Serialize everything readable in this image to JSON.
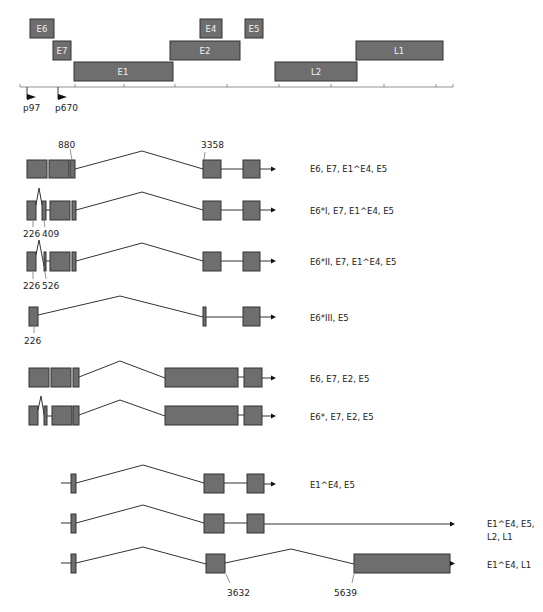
{
  "genome_map": {
    "genes": [
      {
        "name": "E6",
        "x": 30,
        "y": 19,
        "w": 24,
        "h": 19
      },
      {
        "name": "E7",
        "x": 53,
        "y": 41,
        "w": 18,
        "h": 19
      },
      {
        "name": "E1",
        "x": 74,
        "y": 62,
        "w": 99,
        "h": 19
      },
      {
        "name": "E4",
        "x": 200,
        "y": 19,
        "w": 22,
        "h": 19
      },
      {
        "name": "E2",
        "x": 170,
        "y": 41,
        "w": 70,
        "h": 19
      },
      {
        "name": "E5",
        "x": 245,
        "y": 19,
        "w": 18,
        "h": 19
      },
      {
        "name": "L2",
        "x": 275,
        "y": 62,
        "w": 82,
        "h": 19
      },
      {
        "name": "L1",
        "x": 356,
        "y": 41,
        "w": 87,
        "h": 19
      }
    ],
    "axis": {
      "x1": 20,
      "x2": 453,
      "y": 87,
      "ticks": [
        20,
        75,
        124,
        175,
        227,
        279,
        331,
        384,
        436,
        453
      ]
    },
    "promoters": [
      {
        "label": "p97",
        "x": 27
      },
      {
        "label": "p670",
        "x": 58
      }
    ]
  },
  "transcripts": [
    {
      "label": "E6, E7, E1^E4, E5"
    },
    {
      "label": "E6*I, E7, E1^E4, E5"
    },
    {
      "label": "E6*II, E7, E1^E4, E5"
    },
    {
      "label": "E6*III, E5"
    },
    {
      "label": "E6, E7, E2, E5"
    },
    {
      "label": "E6*, E7, E2, E5"
    },
    {
      "label": "E1^E4, E5"
    },
    {
      "label": "E1^E4, E5,",
      "label2": "L2, L1"
    },
    {
      "label": "E1^E4, L1"
    }
  ],
  "splice_sites": {
    "s880": "880",
    "s3358": "3358",
    "s226a": "226",
    "s409": "409",
    "s226b": "226",
    "s526": "526",
    "s226c": "226",
    "s3632": "3632",
    "s5639": "5639"
  }
}
